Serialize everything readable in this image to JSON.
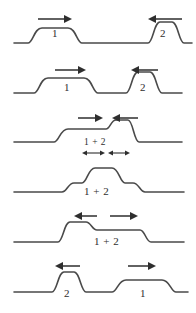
{
  "figure": {
    "line_color": "#4a4a4a",
    "arrow_color": "#2e2e2e",
    "background_color": "#ffffff",
    "panel_count": 6
  },
  "panels": [
    {
      "index": 1,
      "caption": "Two pulses approach each other",
      "labels": [
        {
          "text": "1",
          "x": 55,
          "y": 33
        },
        {
          "text": "2",
          "x": 163,
          "y": 33
        }
      ],
      "arrows": [
        {
          "name": "arrow-right-pulse-1",
          "direction": "right",
          "x1": 38,
          "x2": 70,
          "y": 19
        },
        {
          "name": "arrow-left-pulse-2",
          "direction": "left",
          "x1": 150,
          "x2": 182,
          "y": 19
        }
      ]
    },
    {
      "index": 2,
      "caption": "Pulses move closer together",
      "labels": [
        {
          "text": "1",
          "x": 67,
          "y": 85
        },
        {
          "text": "2",
          "x": 143,
          "y": 85
        }
      ],
      "arrows": [
        {
          "name": "arrow-right-pulse-1",
          "direction": "right",
          "x1": 55,
          "x2": 85,
          "y": 70
        },
        {
          "name": "arrow-left-pulse-2",
          "direction": "left",
          "x1": 132,
          "x2": 158,
          "y": 70
        }
      ]
    },
    {
      "index": 3,
      "caption": "Pulses begin to overlap and add",
      "labels": [
        {
          "text": "1 + 2",
          "x": 84,
          "y": 143
        }
      ],
      "arrows": [
        {
          "name": "arrow-right-pulse-1",
          "direction": "right",
          "x1": 78,
          "x2": 102,
          "y": 120
        },
        {
          "name": "arrow-left-pulse-2",
          "direction": "left",
          "x1": 112,
          "x2": 138,
          "y": 120
        }
      ],
      "measures": [
        {
          "name": "measure-pulse-1",
          "x1": 84,
          "x2": 103,
          "y": 152
        },
        {
          "name": "measure-pulse-2",
          "x1": 110,
          "x2": 128,
          "y": 152
        }
      ]
    },
    {
      "index": 4,
      "caption": "Pulses fully superposed, amplitudes add",
      "labels": [
        {
          "text": "1 + 2",
          "x": 84,
          "y": 186
        }
      ],
      "arrows": []
    },
    {
      "index": 5,
      "caption": "Pulses begin to separate again",
      "labels": [
        {
          "text": "1 + 2",
          "x": 96,
          "y": 239
        }
      ],
      "arrows": [
        {
          "name": "arrow-left-pulse-2",
          "direction": "left",
          "x1": 74,
          "x2": 97,
          "y": 212
        },
        {
          "name": "arrow-right-pulse-1",
          "direction": "right",
          "x1": 110,
          "x2": 137,
          "y": 212
        }
      ]
    },
    {
      "index": 6,
      "caption": "Pulses have passed through each other unchanged",
      "labels": [
        {
          "text": "2",
          "x": 66,
          "y": 290
        },
        {
          "text": "1",
          "x": 142,
          "y": 290
        }
      ],
      "arrows": [
        {
          "name": "arrow-left-pulse-2",
          "direction": "left",
          "x1": 55,
          "x2": 80,
          "y": 263
        },
        {
          "name": "arrow-right-pulse-1",
          "direction": "right",
          "x1": 128,
          "x2": 155,
          "y": 263
        }
      ]
    }
  ]
}
